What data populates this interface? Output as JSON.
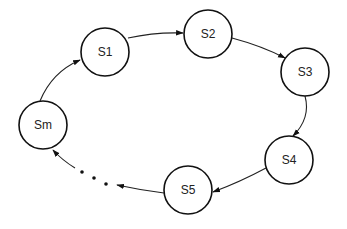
{
  "diagram": {
    "type": "state-cycle",
    "states": [
      {
        "id": "S1",
        "label": "S1",
        "cx": 105,
        "cy": 52,
        "r": 24
      },
      {
        "id": "S2",
        "label": "S2",
        "cx": 208,
        "cy": 34,
        "r": 24
      },
      {
        "id": "S3",
        "label": "S3",
        "cx": 305,
        "cy": 72,
        "r": 24
      },
      {
        "id": "S4",
        "label": "S4",
        "cx": 289,
        "cy": 160,
        "r": 24
      },
      {
        "id": "S5",
        "label": "S5",
        "cx": 188,
        "cy": 190,
        "r": 24
      },
      {
        "id": "Sm",
        "label": "Sm",
        "cx": 43,
        "cy": 150,
        "r": 24
      }
    ],
    "edges": [
      {
        "from": "Sm",
        "to": "S1"
      },
      {
        "from": "S1",
        "to": "S2"
      },
      {
        "from": "S2",
        "to": "S3"
      },
      {
        "from": "S3",
        "to": "S4"
      },
      {
        "from": "S4",
        "to": "S5"
      },
      {
        "from": "S5",
        "to": "...",
        "note": "ellipsis"
      },
      {
        "from": "...",
        "to": "Sm"
      }
    ],
    "ellipsis": "…",
    "stroke_color": "#111111",
    "background": "#ffffff"
  }
}
